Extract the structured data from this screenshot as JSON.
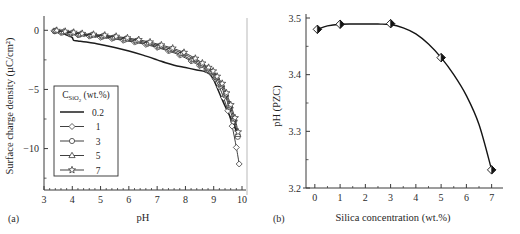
{
  "figure": {
    "panel_a_tag": "(a)",
    "panel_b_tag": "(b)"
  },
  "chart_data": [
    {
      "id": "panel-a",
      "type": "line",
      "title": "",
      "xlabel": "pH",
      "ylabel": "Surface charge density (µC/cm²)",
      "xlim": [
        3,
        10
      ],
      "ylim": [
        -13.5,
        0.7
      ],
      "xticks": [
        3,
        4,
        5,
        6,
        7,
        8,
        9,
        10
      ],
      "xticklabels": [
        "3",
        "4",
        "5",
        "6",
        "7",
        "8",
        "9",
        "10"
      ],
      "yticks": [
        0,
        -5,
        -10
      ],
      "yticklabels": [
        "0",
        "−5",
        "−10"
      ],
      "minor_ticks": true,
      "grid": false,
      "legend": {
        "position": "lower-left-inset",
        "title": "C_SiO2 (wt.%)",
        "title_base": "C",
        "title_sub": "SiO",
        "title_sub2": "2",
        "title_unit": "(wt.%)",
        "entries": [
          {
            "label": "0.2",
            "marker": "none",
            "style": "thick-solid"
          },
          {
            "label": "1",
            "marker": "diamond",
            "style": "thin-solid"
          },
          {
            "label": "3",
            "marker": "circle",
            "style": "thin-solid"
          },
          {
            "label": "5",
            "marker": "triangle",
            "style": "thin-solid"
          },
          {
            "label": "7",
            "marker": "star",
            "style": "thin-solid"
          }
        ]
      },
      "series": [
        {
          "name": "0.2",
          "marker": "none",
          "x": [
            3.32,
            3.5,
            3.7,
            3.9,
            4.0,
            4.05,
            4.2,
            4.5,
            5.0,
            5.5,
            6.0,
            6.5,
            7.0,
            7.3,
            7.6,
            8.0,
            8.4,
            8.7,
            8.85,
            9.0,
            9.2,
            9.4,
            9.6,
            9.8,
            9.9
          ],
          "y": [
            -0.05,
            -0.15,
            -0.3,
            -0.5,
            -0.62,
            -0.85,
            -0.9,
            -1.0,
            -1.2,
            -1.45,
            -1.75,
            -2.1,
            -2.5,
            -2.75,
            -2.95,
            -3.15,
            -3.35,
            -3.5,
            -3.7,
            -4.2,
            -5.3,
            -6.4,
            -7.4,
            -8.5,
            -8.9
          ]
        },
        {
          "name": "1",
          "marker": "diamond",
          "x": [
            3.35,
            3.6,
            3.9,
            4.2,
            4.6,
            5.0,
            5.4,
            5.8,
            6.2,
            6.6,
            7.0,
            7.4,
            7.8,
            8.2,
            8.5,
            8.75,
            8.9,
            9.05,
            9.2,
            9.35,
            9.5,
            9.65,
            9.8,
            9.9
          ],
          "y": [
            -0.05,
            -0.2,
            -0.3,
            -0.4,
            -0.5,
            -0.6,
            -0.7,
            -0.85,
            -1.0,
            -1.2,
            -1.45,
            -1.75,
            -2.1,
            -2.6,
            -3.0,
            -3.35,
            -3.6,
            -4.1,
            -4.8,
            -5.7,
            -6.8,
            -8.1,
            -9.9,
            -11.3
          ]
        },
        {
          "name": "3",
          "marker": "circle",
          "x": [
            3.38,
            3.65,
            3.95,
            4.25,
            4.65,
            5.05,
            5.45,
            5.85,
            6.25,
            6.65,
            7.05,
            7.45,
            7.85,
            8.25,
            8.55,
            8.78,
            8.92,
            9.08,
            9.25,
            9.4,
            9.55,
            9.7,
            9.85
          ],
          "y": [
            -0.08,
            -0.18,
            -0.28,
            -0.38,
            -0.45,
            -0.55,
            -0.65,
            -0.8,
            -0.95,
            -1.15,
            -1.4,
            -1.7,
            -2.05,
            -2.55,
            -2.95,
            -3.3,
            -3.55,
            -4.0,
            -4.7,
            -5.5,
            -6.5,
            -7.7,
            -9.0
          ]
        },
        {
          "name": "5",
          "marker": "triangle",
          "x": [
            3.42,
            3.7,
            4.0,
            4.3,
            4.7,
            5.1,
            5.5,
            5.9,
            6.3,
            6.7,
            7.1,
            7.5,
            7.9,
            8.3,
            8.58,
            8.8,
            8.95,
            9.1,
            9.28,
            9.42,
            9.58,
            9.72,
            9.85
          ],
          "y": [
            -0.04,
            -0.12,
            -0.22,
            -0.32,
            -0.4,
            -0.48,
            -0.58,
            -0.72,
            -0.88,
            -1.08,
            -1.32,
            -1.6,
            -1.95,
            -2.45,
            -2.85,
            -3.2,
            -3.5,
            -3.95,
            -4.6,
            -5.4,
            -6.4,
            -7.5,
            -8.8
          ]
        },
        {
          "name": "7",
          "marker": "star",
          "x": [
            3.45,
            3.75,
            4.05,
            4.35,
            4.75,
            5.15,
            5.55,
            5.95,
            6.35,
            6.75,
            7.15,
            7.55,
            7.95,
            8.35,
            8.6,
            8.82,
            8.98,
            9.12,
            9.3,
            9.45,
            9.6,
            9.75,
            9.86
          ],
          "y": [
            -0.02,
            -0.1,
            -0.18,
            -0.28,
            -0.35,
            -0.42,
            -0.52,
            -0.65,
            -0.8,
            -1.0,
            -1.25,
            -1.52,
            -1.88,
            -2.38,
            -2.78,
            -3.15,
            -3.45,
            -3.9,
            -4.5,
            -5.3,
            -6.3,
            -7.4,
            -8.6
          ]
        }
      ]
    },
    {
      "id": "panel-b",
      "type": "scatter",
      "title": "",
      "xlabel": "Silica concentration (wt.%)",
      "ylabel": "pH (PZC)",
      "xlim": [
        -0.35,
        7.45
      ],
      "ylim": [
        3.2,
        3.5
      ],
      "xticks": [
        0,
        1,
        2,
        3,
        4,
        5,
        6,
        7
      ],
      "xticklabels": [
        "0",
        "1",
        "2",
        "3",
        "4",
        "5",
        "6",
        "7"
      ],
      "yticks": [
        3.2,
        3.3,
        3.4,
        3.5
      ],
      "yticklabels": [
        "3.2",
        "3.3",
        "3.4",
        "3.5"
      ],
      "minor_ticks": true,
      "grid": false,
      "marker": "half-filled-diamond",
      "points": [
        {
          "x": 0.1,
          "y": 3.48
        },
        {
          "x": 1.0,
          "y": 3.489
        },
        {
          "x": 3.0,
          "y": 3.49
        },
        {
          "x": 5.0,
          "y": 3.43
        },
        {
          "x": 7.0,
          "y": 3.232
        }
      ],
      "fit_curve": {
        "x": [
          0.1,
          0.5,
          1.0,
          1.5,
          2.0,
          2.5,
          3.0,
          3.5,
          4.0,
          4.5,
          5.0,
          5.5,
          6.0,
          6.5,
          7.0
        ],
        "y": [
          3.48,
          3.486,
          3.489,
          3.4895,
          3.4895,
          3.4893,
          3.4885,
          3.4825,
          3.472,
          3.454,
          3.43,
          3.4,
          3.363,
          3.312,
          3.232
        ]
      }
    }
  ]
}
